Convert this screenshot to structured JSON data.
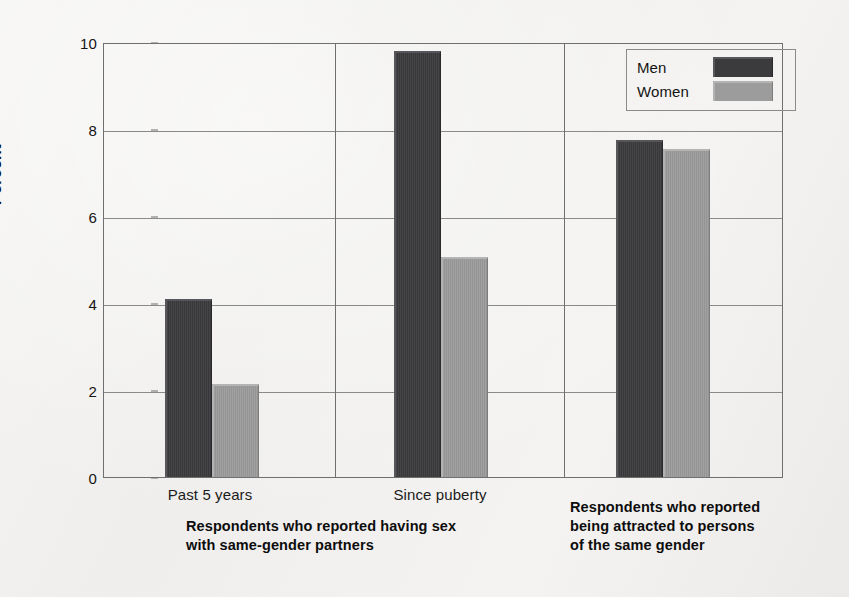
{
  "chart_data": {
    "type": "bar",
    "title": "",
    "xlabel": "",
    "ylabel": "Percent",
    "ylim": [
      0,
      10
    ],
    "yticks": [
      "0",
      "2",
      "4",
      "6",
      "8",
      "10"
    ],
    "grid": true,
    "legend_position": "top-right",
    "categories": [
      "Past 5 years",
      "Since puberty",
      "Respondents who reported being attracted to persons of the same gender"
    ],
    "series": [
      {
        "name": "Men",
        "color": "#3b3b3d",
        "values": [
          4.1,
          9.8,
          7.75
        ]
      },
      {
        "name": "Women",
        "color": "#9c9c9c",
        "values": [
          2.15,
          5.05,
          7.55
        ]
      }
    ],
    "panels": [
      {
        "caption": "Respondents who reported having sex with same-gender partners",
        "caption_line1": "Respondents who reported having sex",
        "caption_line2": "with same-gender partners",
        "groups": [
          {
            "label": "Past 5 years",
            "men": 4.1,
            "women": 2.15
          },
          {
            "label": "Since puberty",
            "men": 9.8,
            "women": 5.05
          }
        ]
      },
      {
        "caption": "Respondents who reported being attracted to persons of the same gender",
        "caption_line1": "Respondents who reported",
        "caption_line2": "being attracted to persons",
        "caption_line3": "of the same gender",
        "groups": [
          {
            "label": "",
            "men": 7.75,
            "women": 7.55
          }
        ]
      }
    ]
  },
  "axis": {
    "y_title": "Percent",
    "tick_10": "10",
    "tick_8": "8",
    "tick_6": "6",
    "tick_4": "4",
    "tick_2": "2",
    "tick_0": "0"
  },
  "labels": {
    "cat_past5": "Past 5 years",
    "cat_since_puberty": "Since puberty"
  },
  "captions": {
    "group1_line1": "Respondents who reported having sex",
    "group1_line2": "with same-gender partners",
    "group2_line1": "Respondents who reported",
    "group2_line2": "being attracted to persons",
    "group2_line3": "of the same gender"
  },
  "legend": {
    "men": "Men",
    "women": "Women"
  },
  "colors": {
    "men": "#3b3b3d",
    "women": "#9c9c9c",
    "background": "#f3f2f0",
    "axis": "#6f6f6f",
    "grid": "#8a8a8a"
  }
}
